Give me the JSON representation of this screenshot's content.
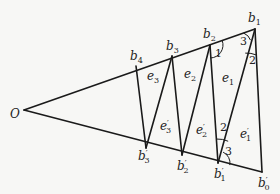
{
  "diagram": {
    "origin": {
      "label": "O",
      "x": 24,
      "y": 110,
      "lx": 10,
      "ly": 118
    },
    "upper_points": [
      {
        "id": "b1",
        "label": "b",
        "sub": "1",
        "x": 255,
        "y": 29,
        "lx": 248,
        "ly": 22
      },
      {
        "id": "b2",
        "label": "b",
        "sub": "2",
        "x": 210,
        "y": 45,
        "lx": 203,
        "ly": 38
      },
      {
        "id": "b3",
        "label": "b",
        "sub": "3",
        "x": 172,
        "y": 56,
        "lx": 166,
        "ly": 50
      },
      {
        "id": "b4",
        "label": "b",
        "sub": "4",
        "x": 136,
        "y": 66,
        "lx": 130,
        "ly": 60
      }
    ],
    "lower_points": [
      {
        "id": "b0p",
        "label": "b",
        "sub": "0",
        "prime": "′",
        "x": 262,
        "y": 172,
        "lx": 258,
        "ly": 187
      },
      {
        "id": "b1p",
        "label": "b",
        "sub": "1",
        "prime": "′",
        "x": 218,
        "y": 163,
        "lx": 214,
        "ly": 178
      },
      {
        "id": "b2p",
        "label": "b",
        "sub": "2",
        "prime": "′",
        "x": 182,
        "y": 155,
        "lx": 177,
        "ly": 170
      },
      {
        "id": "b3p",
        "label": "b",
        "sub": "3",
        "prime": "′",
        "x": 146,
        "y": 148,
        "lx": 138,
        "ly": 160
      }
    ],
    "regions": [
      {
        "id": "e1",
        "label": "e",
        "sub": "1",
        "prime": "",
        "lx": 222,
        "ly": 82
      },
      {
        "id": "e2",
        "label": "e",
        "sub": "2",
        "prime": "",
        "lx": 184,
        "ly": 78
      },
      {
        "id": "e3",
        "label": "e",
        "sub": "3",
        "prime": "",
        "lx": 147,
        "ly": 80
      },
      {
        "id": "e1p",
        "label": "e",
        "sub": "1",
        "prime": "′",
        "lx": 240,
        "ly": 138
      },
      {
        "id": "e2p",
        "label": "e",
        "sub": "2",
        "prime": "′",
        "lx": 196,
        "ly": 134
      },
      {
        "id": "e3p",
        "label": "e",
        "sub": "3",
        "prime": "′",
        "lx": 160,
        "ly": 130
      }
    ],
    "angle_labels": [
      {
        "id": "angle-1",
        "label": "1",
        "lx": 215,
        "ly": 57
      },
      {
        "id": "angle-3-top",
        "label": "3",
        "lx": 240,
        "ly": 45
      },
      {
        "id": "angle-2-top",
        "label": "2",
        "lx": 249,
        "ly": 64
      },
      {
        "id": "angle-2-bottom",
        "label": "2",
        "lx": 220,
        "ly": 131
      },
      {
        "id": "angle-3-bottom",
        "label": "3",
        "lx": 225,
        "ly": 155
      }
    ]
  }
}
